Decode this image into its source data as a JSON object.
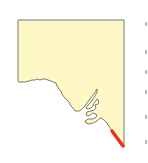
{
  "map": {
    "region": "South Australia",
    "fill_color": "#FDF8C6",
    "outline_color": "#6b6b5e",
    "highlight_color": "#E8361E",
    "highlight_feature": "south-east coastline segment"
  },
  "edge_ticks": [
    22,
    50,
    70,
    90,
    115,
    140
  ]
}
